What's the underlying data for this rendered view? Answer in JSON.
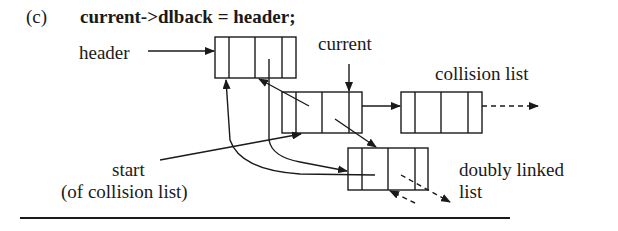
{
  "figure": {
    "part_label": "(c)",
    "code_statement": "current->dlback = header;"
  },
  "labels": {
    "header": "header",
    "current": "current",
    "collision_list": "collision list",
    "start_line1": "start",
    "start_line2": "(of collision list)",
    "doubly_linked_line1": "doubly linked",
    "doubly_linked_line2": "list"
  },
  "nodes": [
    {
      "id": "header-node",
      "fields": 4
    },
    {
      "id": "current-node",
      "fields": 4
    },
    {
      "id": "collision-next-node",
      "fields": 4
    },
    {
      "id": "doubly-linked-node",
      "fields": 4
    }
  ],
  "colors": {
    "ink": "#1a1a1a",
    "background": "#ffffff"
  }
}
